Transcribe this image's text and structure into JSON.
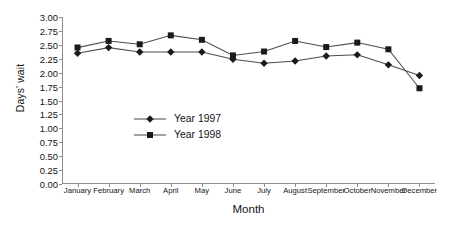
{
  "chart_data": {
    "type": "line",
    "title": "",
    "xlabel": "Month",
    "ylabel": "Days' wait",
    "categories": [
      "January",
      "February",
      "March",
      "April",
      "May",
      "June",
      "July",
      "August",
      "September",
      "October",
      "November",
      "December"
    ],
    "series": [
      {
        "name": "Year 1997",
        "marker": "diamond",
        "color": "#1a1a1a",
        "values": [
          2.35,
          2.45,
          2.37,
          2.37,
          2.37,
          2.24,
          2.17,
          2.21,
          2.3,
          2.32,
          2.14,
          1.95
        ]
      },
      {
        "name": "Year 1998",
        "marker": "square",
        "color": "#1a1a1a",
        "values": [
          2.45,
          2.57,
          2.51,
          2.67,
          2.59,
          2.31,
          2.38,
          2.57,
          2.46,
          2.54,
          2.42,
          1.72
        ]
      }
    ],
    "ylim": [
      0.0,
      3.0
    ],
    "ytick_step": 0.25,
    "ytick_labels": [
      "3.00",
      "2.75",
      "2.50",
      "2.25",
      "2.00",
      "1.75",
      "1.50",
      "1.25",
      "1.00",
      "0.75",
      "0.50",
      "0.25",
      "0.00"
    ],
    "grid": false,
    "legend_position": "center-inside",
    "line_color": "#4d4d4d",
    "axis_color": "#8d8d8d"
  }
}
